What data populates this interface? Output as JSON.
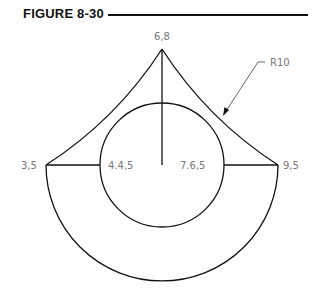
{
  "figure": {
    "title": "FIGURE 8-30"
  },
  "drawing": {
    "points": {
      "apex": "6,8",
      "left": "3,5",
      "right": "9,5",
      "inner_left": "4.4,5",
      "inner_right": "7.6,5"
    },
    "radius_label": "R10",
    "colors": {
      "line": "#111111",
      "label": "#777777",
      "leader": "#555555"
    }
  }
}
